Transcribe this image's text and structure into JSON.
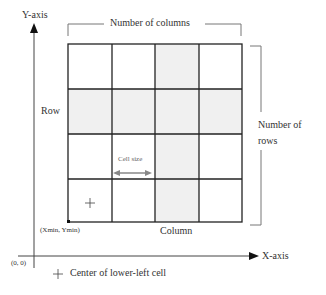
{
  "axes": {
    "y_label": "Y-axis",
    "x_label": "X-axis",
    "origin_label": "(0, 0)"
  },
  "grid": {
    "rows": 4,
    "columns": 4,
    "shaded_cells": [
      [
        0,
        2
      ],
      [
        1,
        0
      ],
      [
        1,
        1
      ],
      [
        1,
        2
      ],
      [
        1,
        3
      ],
      [
        2,
        2
      ],
      [
        3,
        2
      ]
    ],
    "shade_color": "#f0f0f0",
    "line_color": "#222222"
  },
  "labels": {
    "number_of_columns": "Number of columns",
    "number_of_rows_line1": "Number of",
    "number_of_rows_line2": "rows",
    "row": "Row",
    "column": "Column",
    "cell_size": "Cell size",
    "min_corner": "(Xmin, Ymin)",
    "center_marker": "+"
  },
  "legend": {
    "symbol": "+",
    "text": "Center of lower-left cell"
  }
}
